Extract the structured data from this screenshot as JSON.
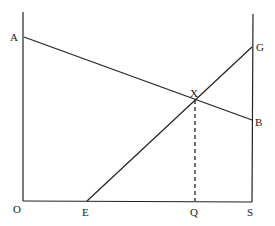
{
  "diagram": {
    "type": "geometric-line-diagram",
    "points": {
      "A": {
        "label": "A",
        "x": 23,
        "y": 37
      },
      "B": {
        "label": "B",
        "x": 252,
        "y": 120
      },
      "G": {
        "label": "G",
        "x": 252,
        "y": 47
      },
      "X": {
        "label": "X",
        "x": 195,
        "y": 99
      },
      "O": {
        "label": "O",
        "x": 23,
        "y": 201
      },
      "E": {
        "label": "E",
        "x": 87,
        "y": 201
      },
      "Q": {
        "label": "Q",
        "x": 195,
        "y": 201
      },
      "S": {
        "label": "S",
        "x": 252,
        "y": 202
      }
    },
    "segments": [
      {
        "from": "O",
        "to": "A",
        "style": "solid",
        "note": "left vertical axis extended upward"
      },
      {
        "from": "O",
        "to": "S",
        "style": "solid",
        "note": "horizontal axis"
      },
      {
        "from": "S",
        "to": "G",
        "style": "solid",
        "note": "right vertical axis extended upward"
      },
      {
        "from": "A",
        "to": "B",
        "style": "solid"
      },
      {
        "from": "E",
        "to": "G",
        "style": "solid"
      },
      {
        "from": "X",
        "to": "Q",
        "style": "dashed"
      }
    ],
    "labels": [
      "A",
      "G",
      "X",
      "B",
      "O",
      "E",
      "Q",
      "S"
    ]
  }
}
